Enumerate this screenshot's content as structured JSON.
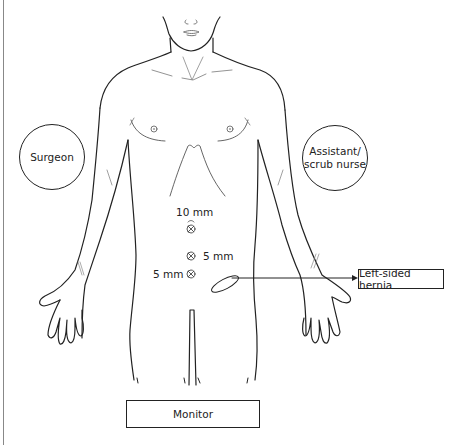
{
  "diagram": {
    "roles": {
      "surgeon": "Surgeon",
      "assistant_line1": "Assistant/",
      "assistant_line2": "scrub nurse"
    },
    "ports": [
      {
        "label": "10 mm",
        "position": "umbilical"
      },
      {
        "label": "5 mm",
        "position": "right-side of midline"
      },
      {
        "label": "5 mm",
        "position": "left of lower port"
      }
    ],
    "callout": "Left-sided hernia",
    "equipment": {
      "monitor": "Monitor"
    },
    "caption": "Fig. — Port positions and theatre set-up for a left-sided hernia (caption truncated)"
  }
}
